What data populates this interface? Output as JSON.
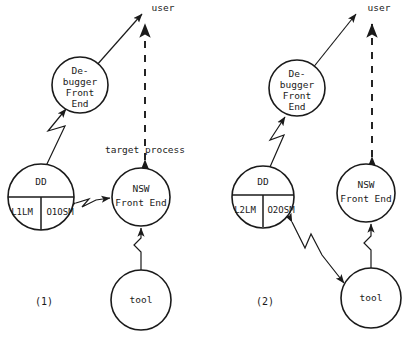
{
  "figure": {
    "panels": [
      {
        "caption": "(1)",
        "caption_pos": {
          "x": 44,
          "y": 302
        },
        "top_label": {
          "text": "user",
          "x": 163,
          "y": 8
        },
        "mid_label": {
          "text": "target process",
          "x": 145,
          "y": 150
        },
        "nodes": [
          {
            "name": "debugger-front-end",
            "lines": [
              "De-",
              "bugger",
              "Front",
              "End"
            ],
            "cx": 80,
            "cy": 85,
            "r": 28
          },
          {
            "name": "dd",
            "lines": [
              "DD"
            ],
            "sub_left": "L1LM",
            "sub_right": "O1OSM",
            "cx": 41,
            "cy": 197,
            "r": 33
          },
          {
            "name": "nsw-front-end",
            "lines": [
              "NSW",
              "Front End"
            ],
            "cx": 141,
            "cy": 197,
            "r": 29
          },
          {
            "name": "tool",
            "lines": [
              "tool"
            ],
            "cx": 141,
            "cy": 300,
            "r": 30
          }
        ]
      },
      {
        "caption": "(2)",
        "caption_pos": {
          "x": 265,
          "y": 302
        },
        "top_label": {
          "text": "user",
          "x": 379,
          "y": 8
        },
        "mid_label": null,
        "nodes": [
          {
            "name": "debugger-front-end",
            "lines": [
              "De-",
              "bugger",
              "Front",
              "End"
            ],
            "cx": 297,
            "cy": 88,
            "r": 28
          },
          {
            "name": "dd",
            "lines": [
              "DD"
            ],
            "sub_left": "L2LM",
            "sub_right": "O2OSM",
            "cx": 263,
            "cy": 197,
            "r": 31
          },
          {
            "name": "nsw-front-end",
            "lines": [
              "NSW",
              "Front End"
            ],
            "cx": 366,
            "cy": 193,
            "r": 29
          },
          {
            "name": "tool",
            "lines": [
              "tool"
            ],
            "cx": 371,
            "cy": 298,
            "r": 30
          }
        ]
      }
    ]
  }
}
